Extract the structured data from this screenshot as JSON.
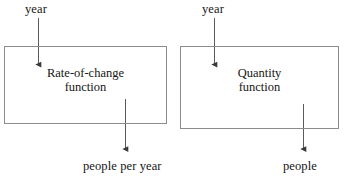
{
  "diagram": {
    "type": "flow-diagram",
    "title": "",
    "style": {
      "box_border_color": "#8c8c8c",
      "arrow_color": "#4d4d4d",
      "text_color": "#151515",
      "background_color": "#ffffff"
    },
    "pipelines": [
      {
        "id": "rate-of-change",
        "input_label": "year",
        "box_label_line1": "Rate-of-change",
        "box_label_line2": "function",
        "output_label": "people per year"
      },
      {
        "id": "quantity",
        "input_label": "year",
        "box_label_line1": "Quantity",
        "box_label_line2": "function",
        "output_label": "people"
      }
    ]
  }
}
